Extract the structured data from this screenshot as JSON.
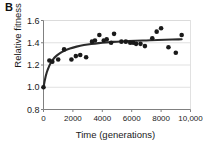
{
  "panel": {
    "label": "B"
  },
  "chart_data": {
    "type": "scatter",
    "title": "",
    "xlabel": "Time (generations)",
    "ylabel": "Relative fitness",
    "xlim": [
      0,
      10000
    ],
    "ylim": [
      0.8,
      1.6
    ],
    "xticks": [
      0,
      2000,
      4000,
      6000,
      8000,
      10000
    ],
    "xtick_labels": [
      "0",
      "2000",
      "4000",
      "6000",
      "8000",
      "10,000"
    ],
    "yticks": [
      0.8,
      1.0,
      1.2,
      1.4,
      1.6
    ],
    "ytick_labels": [
      "0.8",
      "1.0",
      "1.2",
      "1.4",
      "1.6"
    ],
    "grid": "horizontal",
    "legend": "none",
    "marker_color": "#1a1a1a",
    "curve_color": "#2b2b2b",
    "axis_color": "#808080",
    "grid_color": "#d9d9d9",
    "points": [
      [
        0,
        1.0
      ],
      [
        400,
        1.24
      ],
      [
        600,
        1.23
      ],
      [
        1000,
        1.25
      ],
      [
        1400,
        1.34
      ],
      [
        1900,
        1.25
      ],
      [
        2200,
        1.28
      ],
      [
        2500,
        1.29
      ],
      [
        2900,
        1.27
      ],
      [
        3300,
        1.41
      ],
      [
        3500,
        1.42
      ],
      [
        3800,
        1.47
      ],
      [
        4100,
        1.42
      ],
      [
        4300,
        1.43
      ],
      [
        4600,
        1.4
      ],
      [
        4800,
        1.48
      ],
      [
        5300,
        1.41
      ],
      [
        5600,
        1.41
      ],
      [
        5900,
        1.4
      ],
      [
        6100,
        1.4
      ],
      [
        6300,
        1.39
      ],
      [
        6600,
        1.39
      ],
      [
        6900,
        1.37
      ],
      [
        7400,
        1.44
      ],
      [
        7700,
        1.5
      ],
      [
        8000,
        1.53
      ],
      [
        8500,
        1.36
      ],
      [
        9000,
        1.31
      ],
      [
        9400,
        1.47
      ]
    ],
    "fit_curve": {
      "label": "hyperbolic fit",
      "x": [
        0,
        150,
        300,
        500,
        750,
        1000,
        1300,
        1600,
        2000,
        2500,
        3000,
        3500,
        4000,
        4500,
        5000,
        5500,
        6000,
        6500,
        7000,
        7500,
        8000,
        8500,
        9000,
        9400
      ],
      "y": [
        1.0,
        1.105,
        1.165,
        1.225,
        1.268,
        1.296,
        1.321,
        1.339,
        1.357,
        1.373,
        1.385,
        1.393,
        1.4,
        1.405,
        1.41,
        1.413,
        1.416,
        1.419,
        1.421,
        1.424,
        1.426,
        1.428,
        1.43,
        1.431
      ]
    }
  }
}
